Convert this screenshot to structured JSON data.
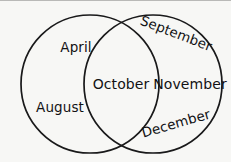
{
  "figure": {
    "type": "venn-diagram",
    "name": "two-circle-venn-of-months",
    "background_color": "#f7f7f5",
    "stroke_color": "#19191a",
    "text_color": "#121214",
    "width": 231,
    "height": 162
  },
  "chart_data": {
    "type": "venn",
    "title": "",
    "sets": [
      {
        "id": "left",
        "name": "left-circle",
        "center_x": 90,
        "center_y": 84,
        "radius": 69,
        "exclusive_items": [
          "April",
          "August"
        ]
      },
      {
        "id": "right",
        "name": "right-circle",
        "center_x": 153,
        "center_y": 84,
        "radius": 69,
        "exclusive_items": [
          "September",
          "November",
          "December"
        ]
      }
    ],
    "intersection": {
      "name": "overlap",
      "items": [
        "October"
      ]
    },
    "all_items": [
      "April",
      "August",
      "October",
      "September",
      "November",
      "December"
    ],
    "legend": "none",
    "grid": false
  },
  "labels": {
    "april": "April",
    "august": "August",
    "october": "October",
    "september": "September",
    "november": "November",
    "december": "December"
  }
}
